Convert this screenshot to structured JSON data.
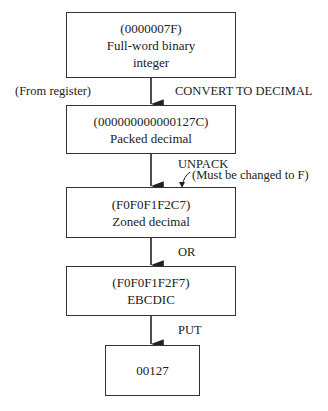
{
  "boxes": [
    {
      "code": "(0000007F)",
      "line1": "Full-word binary",
      "line2": "integer"
    },
    {
      "code": "(000000000000127C)",
      "line1": "Packed decimal"
    },
    {
      "code": "(F0F0F1F2C7)",
      "line1": "Zoned decimal"
    },
    {
      "code": "(F0F0F1F2F7)",
      "line1": "EBCDIC"
    },
    {
      "code": "00127"
    }
  ],
  "edges": [
    {
      "left_label": "(From register)",
      "right_label": "CONVERT TO DECIMAL"
    },
    {
      "right_label": "UNPACK",
      "note": "(Must be changed to F)"
    },
    {
      "right_label": "OR"
    },
    {
      "right_label": "PUT"
    }
  ]
}
